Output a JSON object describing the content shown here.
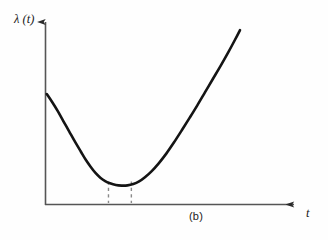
{
  "figure": {
    "caption": "(b)",
    "y_axis_label": "λ (t)",
    "x_axis_label": "t",
    "background_color": "#fefefe",
    "ink_color": "#141414",
    "axis_color": "#555555",
    "dash_color": "#8a8a8a",
    "bleed_text": "scanned page text bleed"
  },
  "chart_data": {
    "type": "line",
    "title": "",
    "subtitle": "",
    "xlabel": "t",
    "ylabel": "λ (t)",
    "legend": [],
    "legend_position": "none",
    "grid": false,
    "axis_style": "arrowed-open-axes",
    "xlim": [
      0,
      1
    ],
    "ylim": [
      0,
      1
    ],
    "tick_labels": {
      "x": [],
      "y": []
    },
    "series": [
      {
        "name": "hazard rate",
        "stroke": "#141414",
        "stroke_width": 2.6,
        "points": [
          [
            0.004,
            0.585
          ],
          [
            0.03,
            0.545
          ],
          [
            0.06,
            0.495
          ],
          [
            0.09,
            0.44
          ],
          [
            0.12,
            0.385
          ],
          [
            0.15,
            0.33
          ],
          [
            0.18,
            0.278
          ],
          [
            0.205,
            0.235
          ],
          [
            0.23,
            0.198
          ],
          [
            0.255,
            0.165
          ],
          [
            0.28,
            0.14
          ],
          [
            0.305,
            0.122
          ],
          [
            0.33,
            0.11
          ],
          [
            0.36,
            0.101
          ],
          [
            0.39,
            0.098
          ],
          [
            0.42,
            0.099
          ],
          [
            0.45,
            0.106
          ],
          [
            0.48,
            0.12
          ],
          [
            0.51,
            0.142
          ],
          [
            0.545,
            0.175
          ],
          [
            0.58,
            0.215
          ],
          [
            0.62,
            0.268
          ],
          [
            0.66,
            0.328
          ],
          [
            0.7,
            0.392
          ],
          [
            0.74,
            0.458
          ],
          [
            0.78,
            0.525
          ],
          [
            0.82,
            0.595
          ],
          [
            0.86,
            0.665
          ],
          [
            0.9,
            0.735
          ],
          [
            0.94,
            0.808
          ],
          [
            0.975,
            0.875
          ],
          [
            1.0,
            0.925
          ]
        ]
      }
    ],
    "markers": [
      {
        "name": "region-start-marker",
        "type": "vertical-dashed",
        "x": 0.322,
        "y_top": 0.12,
        "y_bottom": 0.0
      },
      {
        "name": "region-end-marker",
        "type": "vertical-dashed",
        "x": 0.44,
        "y_top": 0.12,
        "y_bottom": 0.0
      }
    ]
  }
}
